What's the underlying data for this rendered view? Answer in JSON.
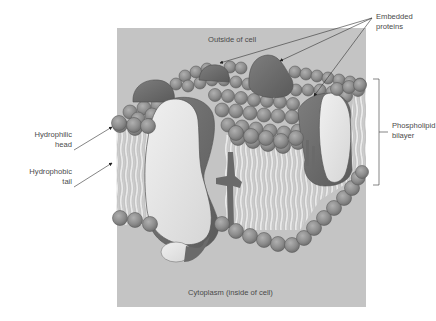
{
  "diagram": {
    "colors": {
      "background_box": "#c4c4c4",
      "phospholipid_head": "#8e8e8e",
      "phospholipid_head_stroke": "#5c5c5c",
      "tail": "#dedede",
      "protein_dark": "#6e6e6e",
      "protein_light": "#e6e6e6",
      "leader_line": "#333333",
      "text": "#4a4a4a"
    },
    "regions": {
      "outside": "Outside of cell",
      "inside": "Cytoplasm (inside of cell)"
    },
    "labels": {
      "embedded_line1": "Embedded",
      "embedded_line2": "proteins",
      "phospholipid_line1": "Phospholipid",
      "phospholipid_line2": "bilayer",
      "head_line1": "Hydrophilic",
      "head_line2": "head",
      "tail_line1": "Hydrophobic",
      "tail_line2": "tail"
    },
    "components": [
      "phospholipid bilayer",
      "hydrophilic heads",
      "hydrophobic tails",
      "embedded proteins",
      "transmembrane channel protein"
    ]
  }
}
